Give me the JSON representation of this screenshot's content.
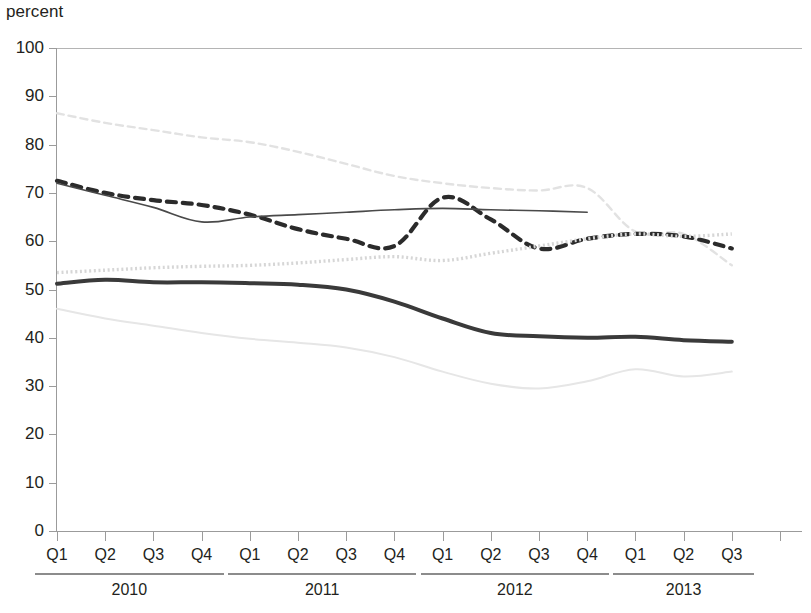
{
  "chart_data": {
    "type": "line",
    "title": "percent",
    "ylabel": "percent",
    "xlabel": "",
    "ylim": [
      0,
      100
    ],
    "ytick_step": 10,
    "yticks": [
      0,
      10,
      20,
      30,
      40,
      50,
      60,
      70,
      80,
      90,
      100
    ],
    "grid": false,
    "legend_position": "none",
    "x": [
      "2010 Q1",
      "2010 Q2",
      "2010 Q3",
      "2010 Q4",
      "2011 Q1",
      "2011 Q2",
      "2011 Q3",
      "2011 Q4",
      "2012 Q1",
      "2012 Q2",
      "2012 Q3",
      "2012 Q4",
      "2013 Q1",
      "2013 Q2",
      "2013 Q3"
    ],
    "quarter_labels": [
      "Q1",
      "Q2",
      "Q3",
      "Q4",
      "Q1",
      "Q2",
      "Q3",
      "Q4",
      "Q1",
      "Q2",
      "Q3",
      "Q4",
      "Q1",
      "Q2",
      "Q3"
    ],
    "year_groups": [
      {
        "label": "2010",
        "quarters": 4
      },
      {
        "label": "2011",
        "quarters": 4
      },
      {
        "label": "2012",
        "quarters": 4
      },
      {
        "label": "2013",
        "quarters": 3
      }
    ],
    "series": [
      {
        "name": "light-dashed-upper",
        "style": "dashed",
        "color": "#e2e2e2",
        "width": 2.4,
        "dash": "7,5",
        "values": [
          86.5,
          84.5,
          83.0,
          81.5,
          80.5,
          78.5,
          76.0,
          73.5,
          72.0,
          71.0,
          70.5,
          71.0,
          62.0,
          61.5,
          55.0
        ]
      },
      {
        "name": "dark-dashed",
        "style": "dashed",
        "color": "#2b2b2b",
        "width": 4.2,
        "dash": "9,7",
        "values": [
          72.5,
          70.0,
          68.5,
          67.5,
          65.5,
          62.5,
          60.5,
          59.0,
          69.0,
          64.5,
          58.5,
          60.5,
          61.5,
          61.0,
          58.5
        ]
      },
      {
        "name": "thin-solid",
        "style": "solid",
        "color": "#4a4a4a",
        "width": 1.6,
        "dash": "",
        "values": [
          72.0,
          69.5,
          67.0,
          64.0,
          65.0,
          65.5,
          66.0,
          66.5,
          66.8,
          66.5,
          66.3,
          66.0,
          null,
          null,
          null
        ]
      },
      {
        "name": "light-dotted-mid",
        "style": "dotted",
        "color": "#d6d6d6",
        "width": 3.4,
        "dash": "2,2.6",
        "values": [
          53.5,
          54.0,
          54.5,
          54.8,
          55.0,
          55.5,
          56.2,
          56.8,
          56.0,
          57.5,
          59.0,
          60.5,
          61.5,
          61.0,
          61.5
        ]
      },
      {
        "name": "thick-solid-dark",
        "style": "solid",
        "color": "#3a3a3a",
        "width": 4.0,
        "dash": "",
        "values": [
          51.2,
          52.0,
          51.5,
          51.5,
          51.3,
          51.0,
          50.0,
          47.5,
          44.0,
          41.0,
          40.3,
          40.0,
          40.2,
          39.5,
          39.2
        ]
      },
      {
        "name": "light-solid-lower",
        "style": "solid",
        "color": "#e6e6e6",
        "width": 2.0,
        "dash": "",
        "values": [
          46.0,
          44.0,
          42.5,
          41.0,
          39.8,
          39.0,
          38.0,
          36.0,
          33.0,
          30.5,
          29.5,
          31.0,
          33.5,
          32.0,
          33.0
        ]
      }
    ]
  }
}
